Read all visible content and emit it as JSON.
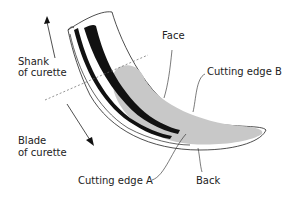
{
  "diagram": {
    "labels": {
      "shank_line1": "Shank",
      "shank_line2": "of curette",
      "blade_line1": "Blade",
      "blade_line2": "of curette",
      "face": "Face",
      "cutting_edge_b": "Cutting edge B",
      "cutting_edge_a": "Cutting edge A",
      "back": "Back"
    },
    "colors": {
      "outline": "#222222",
      "face_fill": "#c8c8c8",
      "band": "#111111",
      "dashed": "#666666"
    }
  }
}
